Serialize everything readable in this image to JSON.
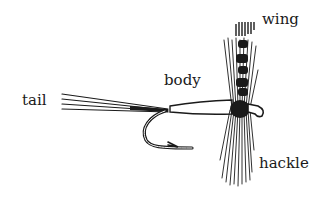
{
  "diagram": {
    "labels": {
      "wing": "wing",
      "body": "body",
      "tail": "tail",
      "hackle": "hackle"
    },
    "colors": {
      "ink": "#1a1a1a",
      "background": "#ffffff"
    }
  }
}
